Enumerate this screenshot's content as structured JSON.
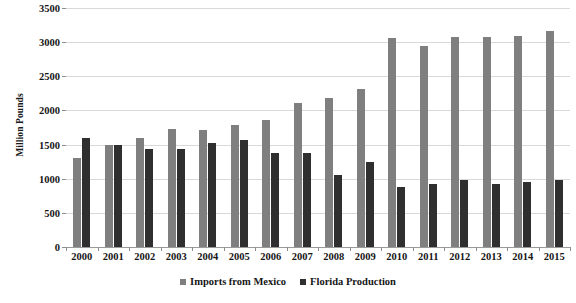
{
  "chart_data": {
    "type": "bar",
    "title": "",
    "xlabel": "",
    "ylabel": "Million Pounds",
    "ylim": [
      0,
      3500
    ],
    "ytick_step": 500,
    "yticks": [
      3500,
      3000,
      2500,
      2000,
      1500,
      1000,
      500,
      0
    ],
    "grid": true,
    "legend_position": "bottom",
    "categories": [
      "2000",
      "2001",
      "2002",
      "2003",
      "2004",
      "2005",
      "2006",
      "2007",
      "2008",
      "2009",
      "2010",
      "2011",
      "2012",
      "2013",
      "2014",
      "2015"
    ],
    "series": [
      {
        "name": "Imports from Mexico",
        "color": "#7f7f7f",
        "values": [
          1300,
          1500,
          1600,
          1730,
          1720,
          1780,
          1860,
          2110,
          2180,
          2320,
          3060,
          2950,
          3070,
          3070,
          3090,
          3160
        ]
      },
      {
        "name": "Florida Production",
        "color": "#2f2f2f",
        "values": [
          1590,
          1490,
          1430,
          1430,
          1530,
          1570,
          1380,
          1370,
          1050,
          1250,
          880,
          930,
          980,
          920,
          950,
          980
        ]
      }
    ]
  },
  "legend": {
    "items": [
      {
        "label": "Imports from Mexico",
        "swatch": "imports"
      },
      {
        "label": "Florida Production",
        "swatch": "florida"
      }
    ]
  }
}
